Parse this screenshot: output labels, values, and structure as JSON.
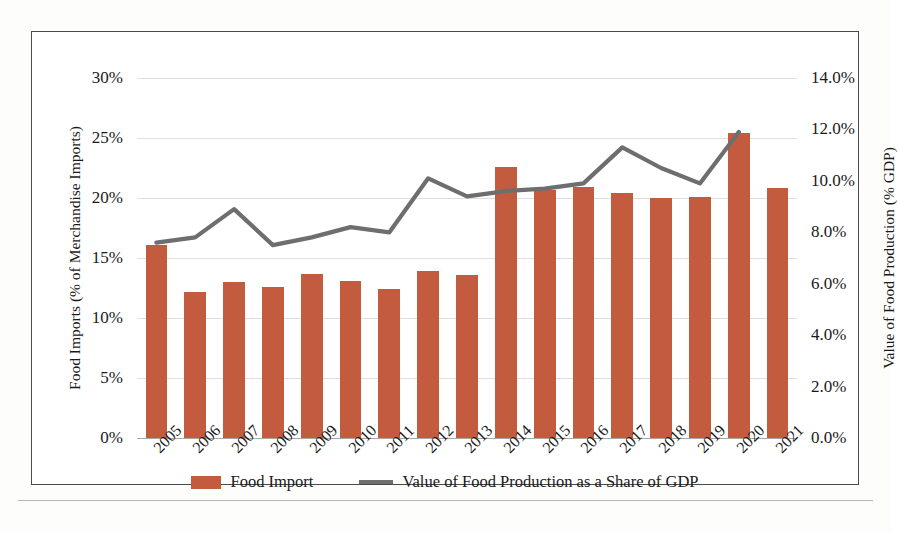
{
  "chart_data": {
    "type": "bar",
    "title": "",
    "xlabel": "",
    "categories": [
      "2005",
      "2006",
      "2007",
      "2008",
      "2009",
      "2010",
      "2011",
      "2012",
      "2013",
      "2014",
      "2015",
      "2016",
      "2017",
      "2018",
      "2019",
      "2020",
      "2021"
    ],
    "grid": true,
    "legend_position": "bottom",
    "series": [
      {
        "name": "Food Import",
        "type": "bar",
        "axis": "left",
        "color": "#c35c3e",
        "values": [
          16.1,
          12.2,
          13.0,
          12.6,
          13.7,
          13.1,
          12.4,
          13.9,
          13.6,
          22.6,
          20.7,
          20.9,
          20.4,
          20.0,
          20.1,
          25.4,
          20.8
        ]
      },
      {
        "name": "Value of Food Production as a Share of GDP",
        "type": "line",
        "axis": "right",
        "color": "#6e6e6e",
        "values": [
          7.6,
          7.8,
          8.9,
          7.5,
          7.8,
          8.2,
          8.0,
          10.1,
          9.4,
          9.6,
          9.7,
          9.9,
          11.3,
          10.5,
          9.9,
          11.9,
          null
        ]
      }
    ],
    "left_axis": {
      "label": "Food Imports (% of Merchandise Imports)",
      "min": 0,
      "max": 30,
      "step": 5,
      "ticks": [
        "0%",
        "5%",
        "10%",
        "15%",
        "20%",
        "25%",
        "30%"
      ]
    },
    "right_axis": {
      "label": "Value of Food Production (% GDP)",
      "min": 0,
      "max": 14,
      "step": 2,
      "ticks": [
        "0.0%",
        "2.0%",
        "4.0%",
        "6.0%",
        "8.0%",
        "10.0%",
        "12.0%",
        "14.0%"
      ]
    },
    "legend": [
      {
        "label": "Food Import",
        "marker": "bar-swatch",
        "color": "#c35c3e"
      },
      {
        "label": "Value of Food Production as a Share of GDP",
        "marker": "line-swatch",
        "color": "#6e6e6e"
      }
    ]
  }
}
